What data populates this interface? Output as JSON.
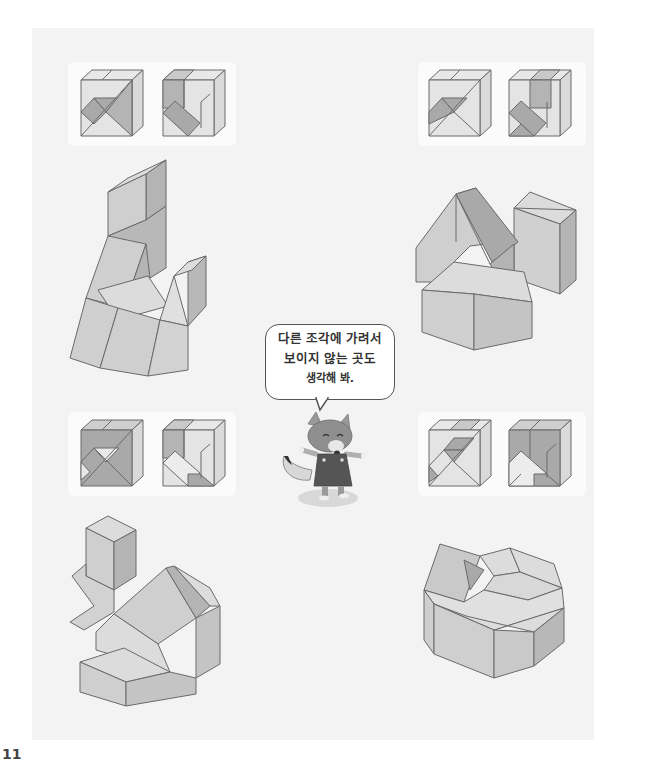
{
  "page": {
    "background": "#f3f3f3",
    "page_number": "11"
  },
  "speech_bubble": {
    "lines": [
      "다른 조각에 가려서",
      "보이지 않는 곳도",
      "생각해 봐."
    ]
  },
  "character": {
    "name": "fox",
    "description": "cartoon fox character in overalls"
  },
  "puzzles": [
    {
      "id": "top-left",
      "cube_views": 2,
      "figure": "tall-tower-with-prisms"
    },
    {
      "id": "top-right",
      "cube_views": 2,
      "figure": "house-shapes-and-cube"
    },
    {
      "id": "bottom-left",
      "cube_views": 2,
      "figure": "cube-stack-with-prisms"
    },
    {
      "id": "bottom-right",
      "cube_views": 2,
      "figure": "octagonal-block-arrangement"
    }
  ],
  "colors": {
    "light_face": "#e4e4e4",
    "mid_face": "#c9c9c9",
    "dark_face": "#a9a9a9",
    "line": "#6a6a6a"
  }
}
